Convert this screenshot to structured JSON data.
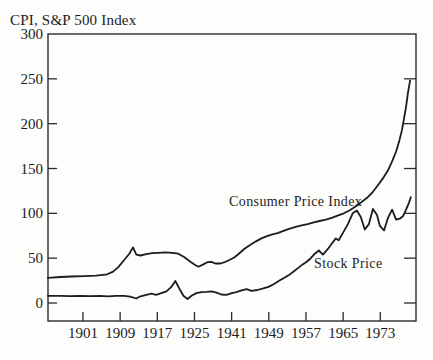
{
  "chart_data": {
    "type": "line",
    "title": "CPI, S&P 500 Index",
    "xlabel": "",
    "ylabel": "CPI, S&P 500 Index",
    "x_axis": {
      "tick_labels": [
        "1901",
        "1909",
        "1917",
        "1925",
        "1941",
        "1949",
        "1957",
        "1965",
        "1973"
      ],
      "tick_positions": [
        0.095,
        0.196,
        0.297,
        0.398,
        0.499,
        0.6,
        0.701,
        0.802,
        0.903
      ]
    },
    "y_axis": {
      "tick_values": [
        0,
        50,
        100,
        150,
        200,
        250,
        300
      ],
      "tick_labels": [
        "0",
        "50",
        "100",
        "150",
        "200",
        "250",
        "300"
      ],
      "range": [
        0,
        300
      ]
    },
    "grid": false,
    "legend": "inline-annotations",
    "annotations": [
      {
        "text": "Consumer Price Index",
        "series": "cpi"
      },
      {
        "text": "Stock Price",
        "series": "stock"
      }
    ],
    "colors": {
      "line": "#1c1c1c",
      "frame": "#2a2a2a",
      "background": "#fdfdfc"
    },
    "series": [
      {
        "id": "cpi",
        "name": "Consumer Price Index",
        "points": [
          [
            0.0,
            28
          ],
          [
            0.033,
            29
          ],
          [
            0.065,
            29.5
          ],
          [
            0.098,
            30
          ],
          [
            0.131,
            30.5
          ],
          [
            0.161,
            32
          ],
          [
            0.177,
            35
          ],
          [
            0.191,
            40
          ],
          [
            0.207,
            48
          ],
          [
            0.221,
            55
          ],
          [
            0.231,
            62
          ],
          [
            0.24,
            54
          ],
          [
            0.251,
            53
          ],
          [
            0.267,
            54.5
          ],
          [
            0.283,
            55.5
          ],
          [
            0.3,
            56
          ],
          [
            0.319,
            56.5
          ],
          [
            0.338,
            56
          ],
          [
            0.354,
            55
          ],
          [
            0.371,
            51
          ],
          [
            0.387,
            46
          ],
          [
            0.401,
            42
          ],
          [
            0.409,
            40.5
          ],
          [
            0.422,
            43
          ],
          [
            0.433,
            45.5
          ],
          [
            0.444,
            46
          ],
          [
            0.455,
            44
          ],
          [
            0.469,
            44
          ],
          [
            0.48,
            45.5
          ],
          [
            0.493,
            48
          ],
          [
            0.507,
            51
          ],
          [
            0.52,
            55.5
          ],
          [
            0.534,
            60.5
          ],
          [
            0.548,
            64.5
          ],
          [
            0.564,
            68.5
          ],
          [
            0.58,
            72
          ],
          [
            0.597,
            75
          ],
          [
            0.61,
            76.5
          ],
          [
            0.624,
            78
          ],
          [
            0.64,
            80.5
          ],
          [
            0.657,
            83
          ],
          [
            0.673,
            85
          ],
          [
            0.689,
            86.5
          ],
          [
            0.706,
            88
          ],
          [
            0.722,
            90
          ],
          [
            0.738,
            91.5
          ],
          [
            0.755,
            93
          ],
          [
            0.771,
            95
          ],
          [
            0.787,
            97.5
          ],
          [
            0.804,
            100
          ],
          [
            0.82,
            103.5
          ],
          [
            0.837,
            108
          ],
          [
            0.853,
            113
          ],
          [
            0.869,
            118
          ],
          [
            0.883,
            124
          ],
          [
            0.896,
            131
          ],
          [
            0.91,
            139
          ],
          [
            0.924,
            148
          ],
          [
            0.935,
            158
          ],
          [
            0.946,
            169
          ],
          [
            0.954,
            180
          ],
          [
            0.962,
            193
          ],
          [
            0.967,
            205
          ],
          [
            0.973,
            219
          ],
          [
            0.978,
            234
          ],
          [
            0.984,
            248
          ]
        ]
      },
      {
        "id": "stock",
        "name": "Stock Price",
        "points": [
          [
            0.0,
            8
          ],
          [
            0.033,
            8
          ],
          [
            0.06,
            7.7
          ],
          [
            0.087,
            8
          ],
          [
            0.114,
            7.6
          ],
          [
            0.142,
            8
          ],
          [
            0.163,
            7.5
          ],
          [
            0.185,
            8
          ],
          [
            0.207,
            8
          ],
          [
            0.223,
            7
          ],
          [
            0.24,
            5
          ],
          [
            0.251,
            7.5
          ],
          [
            0.267,
            9
          ],
          [
            0.281,
            10.5
          ],
          [
            0.294,
            9
          ],
          [
            0.308,
            11
          ],
          [
            0.322,
            13
          ],
          [
            0.335,
            18
          ],
          [
            0.346,
            24.5
          ],
          [
            0.357,
            16
          ],
          [
            0.368,
            8
          ],
          [
            0.379,
            4.5
          ],
          [
            0.39,
            8
          ],
          [
            0.403,
            11
          ],
          [
            0.417,
            12
          ],
          [
            0.431,
            12.5
          ],
          [
            0.444,
            13
          ],
          [
            0.458,
            11.5
          ],
          [
            0.471,
            9.5
          ],
          [
            0.485,
            9
          ],
          [
            0.499,
            11
          ],
          [
            0.512,
            12
          ],
          [
            0.526,
            14
          ],
          [
            0.54,
            15.5
          ],
          [
            0.553,
            13.5
          ],
          [
            0.569,
            14.5
          ],
          [
            0.583,
            16
          ],
          [
            0.599,
            18
          ],
          [
            0.613,
            21
          ],
          [
            0.629,
            25
          ],
          [
            0.646,
            29
          ],
          [
            0.659,
            32.5
          ],
          [
            0.67,
            36
          ],
          [
            0.681,
            39.5
          ],
          [
            0.692,
            43
          ],
          [
            0.703,
            46
          ],
          [
            0.714,
            50
          ],
          [
            0.725,
            55
          ],
          [
            0.736,
            58.5
          ],
          [
            0.747,
            54
          ],
          [
            0.76,
            60
          ],
          [
            0.771,
            66
          ],
          [
            0.782,
            72
          ],
          [
            0.79,
            70
          ],
          [
            0.801,
            78
          ],
          [
            0.815,
            88
          ],
          [
            0.828,
            100
          ],
          [
            0.839,
            103
          ],
          [
            0.85,
            96
          ],
          [
            0.861,
            82
          ],
          [
            0.872,
            88
          ],
          [
            0.883,
            105
          ],
          [
            0.894,
            98
          ],
          [
            0.902,
            86
          ],
          [
            0.913,
            81
          ],
          [
            0.924,
            95
          ],
          [
            0.935,
            104
          ],
          [
            0.946,
            93
          ],
          [
            0.956,
            94
          ],
          [
            0.965,
            97
          ],
          [
            0.973,
            104
          ],
          [
            0.981,
            112
          ],
          [
            0.986,
            118
          ]
        ]
      }
    ]
  }
}
